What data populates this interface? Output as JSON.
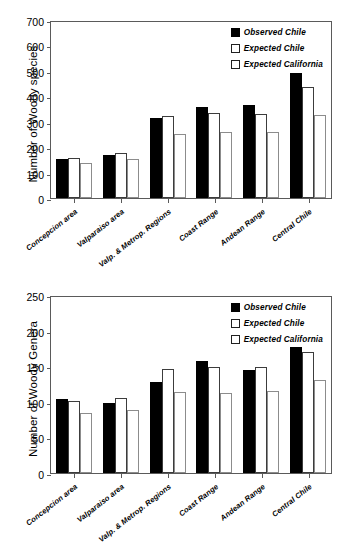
{
  "chart_data": [
    {
      "type": "bar",
      "id": "woody-species",
      "title": "",
      "xlabel": "",
      "ylabel": "Number of Woody species",
      "ylim": [
        0,
        700
      ],
      "yticks": [
        700,
        600,
        500,
        400,
        300,
        200,
        100,
        0
      ],
      "grid": false,
      "legend_position": "top-right",
      "categories": [
        "Concepcion area",
        "Valparaiso area",
        "Valp. & Metrop. Regions",
        "Coast Range",
        "Andean Range",
        "Central Chile"
      ],
      "series": [
        {
          "name": "Observed Chile",
          "values": [
            152,
            170,
            313,
            358,
            364,
            492
          ]
        },
        {
          "name": "Expected Chile",
          "values": [
            158,
            178,
            321,
            333,
            332,
            435
          ]
        },
        {
          "name": "Expected California",
          "values": [
            137,
            152,
            251,
            261,
            259,
            325
          ]
        }
      ]
    },
    {
      "type": "bar",
      "id": "woody-genera",
      "title": "",
      "xlabel": "",
      "ylabel": "Number of Woody Genera",
      "ylim": [
        0,
        250
      ],
      "yticks": [
        250,
        200,
        150,
        100,
        50,
        0
      ],
      "grid": false,
      "legend_position": "top-right",
      "categories": [
        "Concepcion area",
        "Valparaiso area",
        "Valp. & Metrop. Regions",
        "Coast Range",
        "Andean Range",
        "Central Chile"
      ],
      "series": [
        {
          "name": "Observed Chile",
          "values": [
            104,
            98,
            128,
            157,
            145,
            177
          ]
        },
        {
          "name": "Expected Chile",
          "values": [
            101,
            106,
            146,
            149,
            149,
            170
          ]
        },
        {
          "name": "Expected California",
          "values": [
            84,
            88,
            114,
            113,
            115,
            130
          ]
        }
      ]
    }
  ],
  "colors": {
    "observed_chile": "#000000",
    "expected_chile": "#ffffff",
    "expected_california": "#ffffff",
    "axis": "#5a5a5a",
    "background": "#ffffff"
  }
}
